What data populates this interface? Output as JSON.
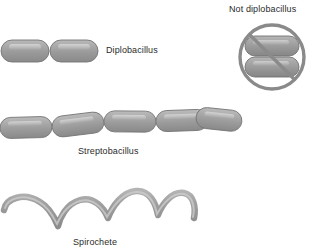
{
  "canvas": {
    "width": 315,
    "height": 252,
    "background": "#ffffff"
  },
  "palette": {
    "rod_fill_dark": "#8e8e8e",
    "rod_fill_mid": "#9d9d9d",
    "rod_fill_light": "#c2c2c2",
    "rod_highlight": "#d2d2d2",
    "rod_outline": "#6f6f6f",
    "prohibition_ring": "#8a8a8a",
    "text": "#2b2b2b"
  },
  "labels": {
    "diplobacillus": "Diplobacillus",
    "not_diplobacillus": "Not diplobacillus",
    "streptobacillus": "Streptobacillus",
    "spirochete": "Spirochete"
  },
  "figures": {
    "diplobacillus": {
      "name": "diplobacillus-figure",
      "description": "two rod-shaped bacteria joined end to end",
      "rod_count": 2
    },
    "not_diplobacillus": {
      "name": "not-diplobacillus-figure",
      "description": "two rods stacked side by side inside a prohibition circle with diagonal slash",
      "rod_count": 2,
      "prohibition": true
    },
    "streptobacillus": {
      "name": "streptobacillus-figure",
      "description": "chain of five rod-shaped bacteria joined end to end at slight angles",
      "rod_count": 5
    },
    "spirochete": {
      "name": "spirochete-figure",
      "description": "long helical wavy filament with four arches",
      "arch_count": 4
    }
  }
}
